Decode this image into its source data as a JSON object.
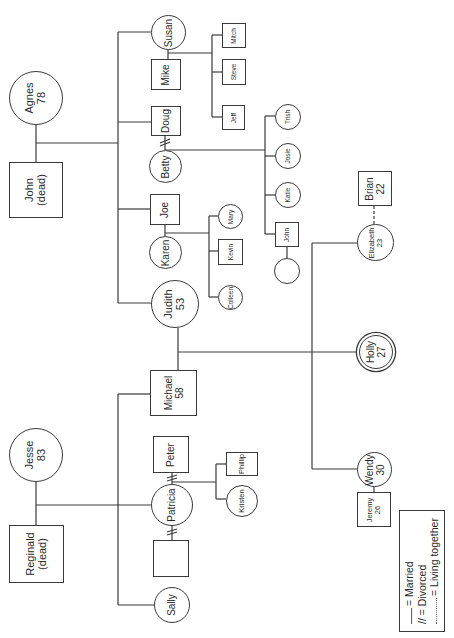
{
  "diagram": {
    "type": "genogram",
    "orientation": "rotated-90-ccw"
  },
  "people": {
    "agnes": {
      "name": "Agnes",
      "age": "78",
      "sex": "female"
    },
    "john_sr": {
      "name": "John",
      "note": "(dead)",
      "sex": "male"
    },
    "susan": {
      "name": "Susan",
      "sex": "female"
    },
    "mike": {
      "name": "Mike",
      "sex": "male"
    },
    "mitch": {
      "name": "Mitch",
      "sex": "male"
    },
    "steve": {
      "name": "Steve",
      "sex": "male"
    },
    "jeff": {
      "name": "Jeff",
      "sex": "male"
    },
    "doug": {
      "name": "Doug",
      "sex": "male"
    },
    "betty": {
      "name": "Betty",
      "sex": "female"
    },
    "trish": {
      "name": "Trish",
      "sex": "female"
    },
    "josie": {
      "name": "Josie",
      "sex": "female"
    },
    "katie": {
      "name": "Katie",
      "sex": "female"
    },
    "john_jr": {
      "name": "John",
      "sex": "male"
    },
    "john_jr_spouse": {
      "name": "",
      "sex": "female"
    },
    "joe": {
      "name": "Joe",
      "sex": "male"
    },
    "karen": {
      "name": "Karen",
      "sex": "female"
    },
    "mary": {
      "name": "Mary",
      "sex": "female"
    },
    "kevin": {
      "name": "Kevin",
      "sex": "male"
    },
    "colleen": {
      "name": "Colleen",
      "sex": "female"
    },
    "judith": {
      "name": "Judith",
      "age": "53",
      "sex": "female"
    },
    "michael": {
      "name": "Michael",
      "age": "58",
      "sex": "male"
    },
    "elizabeth": {
      "name": "Elizabeth",
      "age": "23",
      "sex": "female"
    },
    "brian": {
      "name": "Brian",
      "age": "22",
      "sex": "male"
    },
    "holly": {
      "name": "Holly",
      "age": "27",
      "sex": "female",
      "identified_patient": true
    },
    "wendy": {
      "name": "Wendy",
      "age": "30",
      "sex": "female"
    },
    "jeremy": {
      "name": "Jeremy",
      "age": "26",
      "sex": "male"
    },
    "jesse": {
      "name": "Jesse",
      "age": "83",
      "sex": "female"
    },
    "reginald": {
      "name": "Reginald",
      "note": "(dead)",
      "sex": "male"
    },
    "peter": {
      "name": "Peter",
      "sex": "male"
    },
    "patricia": {
      "name": "Patricia",
      "sex": "female"
    },
    "phillip": {
      "name": "Phillip",
      "sex": "male"
    },
    "kristen": {
      "name": "Kristen",
      "sex": "female"
    },
    "patricia_ex": {
      "name": "",
      "sex": "male"
    },
    "sally": {
      "name": "Sally",
      "sex": "female"
    }
  },
  "relationships": [
    {
      "a": "Agnes",
      "b": "John (dead)",
      "type": "married"
    },
    {
      "a": "Susan",
      "b": "Mike",
      "type": "married"
    },
    {
      "a": "Doug",
      "b": "Betty",
      "type": "divorced"
    },
    {
      "a": "Joe",
      "b": "Karen",
      "type": "married"
    },
    {
      "a": "John",
      "b": "(unnamed)",
      "type": "married"
    },
    {
      "a": "Judith",
      "b": "Michael",
      "type": "married"
    },
    {
      "a": "Elizabeth",
      "b": "Brian",
      "type": "living-together"
    },
    {
      "a": "Wendy",
      "b": "Jeremy",
      "type": "married"
    },
    {
      "a": "Jesse",
      "b": "Reginald (dead)",
      "type": "married"
    },
    {
      "a": "Patricia",
      "b": "Peter",
      "type": "divorced"
    },
    {
      "a": "Patricia",
      "b": "(unnamed)",
      "type": "divorced"
    }
  ],
  "legend": {
    "married": "= Married",
    "divorced_symbol": "//",
    "divorced": "= Divorced",
    "living_together": "= Living together"
  }
}
